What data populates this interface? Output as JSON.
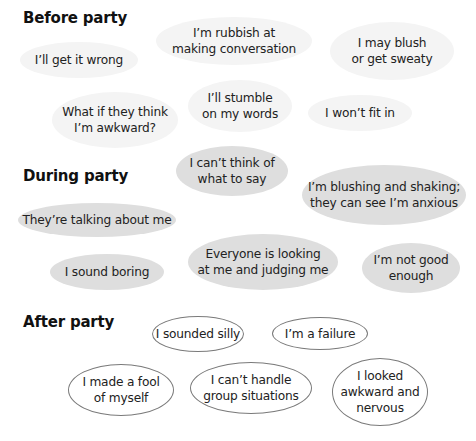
{
  "sections": {
    "before": {
      "title": "Before party",
      "bubbles": [
        {
          "text": "I’ll get it wrong",
          "x": 20,
          "y": 42,
          "w": 118,
          "h": 36
        },
        {
          "text": "I’m rubbish at\nmaking conversation",
          "x": 156,
          "y": 17,
          "w": 156,
          "h": 48
        },
        {
          "text": "I may blush\nor get sweaty",
          "x": 330,
          "y": 22,
          "w": 124,
          "h": 58
        },
        {
          "text": "What if they think\nI’m awkward?",
          "x": 52,
          "y": 92,
          "w": 126,
          "h": 56
        },
        {
          "text": "I’ll stumble\non my words",
          "x": 188,
          "y": 80,
          "w": 104,
          "h": 52
        },
        {
          "text": "I won’t fit in",
          "x": 308,
          "y": 95,
          "w": 104,
          "h": 36
        }
      ]
    },
    "during": {
      "title": "During party",
      "bubbles": [
        {
          "text": "I can’t think of\nwhat to say",
          "x": 176,
          "y": 146,
          "w": 112,
          "h": 50
        },
        {
          "text": "I’m blushing and shaking;\nthey can see I’m anxious",
          "x": 302,
          "y": 165,
          "w": 164,
          "h": 60
        },
        {
          "text": "They’re talking about me",
          "x": 18,
          "y": 203,
          "w": 158,
          "h": 34
        },
        {
          "text": "I sound boring",
          "x": 50,
          "y": 254,
          "w": 114,
          "h": 36
        },
        {
          "text": "Everyone is looking\nat me and judging me",
          "x": 188,
          "y": 234,
          "w": 150,
          "h": 56
        },
        {
          "text": "I’m not good\nenough",
          "x": 362,
          "y": 243,
          "w": 98,
          "h": 50
        }
      ]
    },
    "after": {
      "title": "After party",
      "bubbles": [
        {
          "text": "I sounded silly",
          "x": 152,
          "y": 316,
          "w": 92,
          "h": 36
        },
        {
          "text": "I’m a failure",
          "x": 272,
          "y": 317,
          "w": 96,
          "h": 33
        },
        {
          "text": "I made a fool\nof myself",
          "x": 68,
          "y": 364,
          "w": 106,
          "h": 52
        },
        {
          "text": "I can’t handle\ngroup situations",
          "x": 190,
          "y": 362,
          "w": 122,
          "h": 52
        },
        {
          "text": "I looked\nawkward and\nnervous",
          "x": 332,
          "y": 358,
          "w": 96,
          "h": 68
        }
      ]
    }
  },
  "colors": {
    "before_fill": "#f4f4f4",
    "during_fill": "#dedede",
    "after_fill": "#ffffff",
    "after_stroke": "#7a7a7a",
    "text": "#222222"
  }
}
